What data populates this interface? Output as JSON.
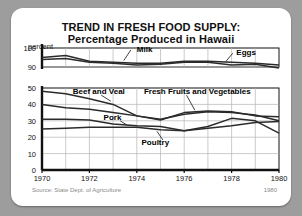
{
  "card": {
    "source_note": "Source: State Dept. of Agriculture",
    "corner_note": "1980"
  },
  "chart_data": {
    "type": "line",
    "title": "TREND IN FRESH FOOD SUPPLY:",
    "subtitle": "Percentage Produced in Hawaii",
    "ylabel": "percent",
    "xlabel": "",
    "grid": true,
    "legend_position": "inline-labels",
    "broken_axis": true,
    "upper_panel": {
      "ticks": [
        90,
        100
      ],
      "ylim": [
        88,
        100
      ]
    },
    "lower_panel": {
      "ticks": [
        0,
        10,
        20,
        30,
        40,
        50
      ],
      "ylim": [
        0,
        52
      ]
    },
    "x": [
      1970,
      1971,
      1972,
      1973,
      1974,
      1975,
      1976,
      1977,
      1978,
      1979,
      1980
    ],
    "xticks": [
      1970,
      1972,
      1974,
      1976,
      1978,
      1980
    ],
    "xlim": [
      1970,
      1980
    ],
    "series": [
      {
        "name": "Milk",
        "panel": "upper",
        "values": [
          95,
          96,
          93,
          92.5,
          92,
          92,
          93,
          93,
          92.5,
          92,
          91
        ],
        "label_x": 1974.0,
        "label_y": 99.2
      },
      {
        "name": "Eggs",
        "panel": "upper",
        "values": [
          94,
          94.5,
          92.5,
          92,
          91,
          91.5,
          92.5,
          92.5,
          91,
          91.5,
          89.5
        ],
        "label_x": 1978.2,
        "label_y": 97.5
      },
      {
        "name": "Beef and Veal",
        "panel": "lower",
        "values": [
          48,
          46.5,
          43.5,
          40,
          33,
          31,
          34,
          35.5,
          35,
          33.5,
          30
        ],
        "label_x": 1971.3,
        "label_y": 47.5
      },
      {
        "name": "Fresh Fruits and Vegetables",
        "panel": "lower",
        "values": [
          40,
          38,
          37,
          35,
          33,
          30.5,
          35,
          36,
          35.5,
          33,
          32.5
        ],
        "label_x": 1974.3,
        "label_y": 47.5
      },
      {
        "name": "Pork",
        "panel": "lower",
        "values": [
          31,
          31,
          30.5,
          28,
          27,
          26.5,
          24,
          26.5,
          31.5,
          30,
          22.5
        ],
        "label_x": 1972.6,
        "label_y": 31.5
      },
      {
        "name": "Poultry",
        "panel": "lower",
        "values": [
          25,
          25.5,
          26,
          26,
          26,
          24.5,
          24,
          25.5,
          27,
          29,
          29.5
        ],
        "label_x": 1974.2,
        "label_y": 16.5
      }
    ]
  }
}
